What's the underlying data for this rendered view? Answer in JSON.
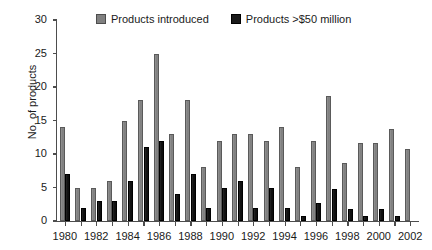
{
  "chart_data": {
    "type": "bar",
    "title": "",
    "xlabel": "",
    "ylabel": "No. of products",
    "ylim": [
      0,
      30
    ],
    "ytick_step": 5,
    "yticks": [
      0,
      5,
      10,
      15,
      20,
      25,
      30
    ],
    "grid": false,
    "legend_position": "top-center",
    "xtick_labels": [
      "1980",
      "1982",
      "1984",
      "1986",
      "1988",
      "1990",
      "1992",
      "1994",
      "1996",
      "1998",
      "2000",
      "2002"
    ],
    "categories": [
      "1980",
      "1981",
      "1982",
      "1983",
      "1984",
      "1985",
      "1986",
      "1987",
      "1988",
      "1989",
      "1990",
      "1991",
      "1992",
      "1993",
      "1994",
      "1995",
      "1996",
      "1997",
      "1998",
      "1999",
      "2000",
      "2001",
      "2002"
    ],
    "series": [
      {
        "name": "Products introduced",
        "color": "#808080",
        "values": [
          14,
          5,
          5,
          6,
          15,
          18,
          25,
          13,
          18,
          8,
          12,
          13,
          13,
          12,
          14,
          8,
          12,
          18.7,
          8.7,
          11.7,
          11.7,
          13.8,
          10.7
        ]
      },
      {
        "name": "Products >$50 million",
        "color": "#1a1a1a",
        "values": [
          7,
          2,
          3,
          3,
          6,
          11,
          12,
          4,
          7,
          2,
          5,
          6,
          2,
          5,
          2,
          0.8,
          2.7,
          4.8,
          1.8,
          0.8,
          1.8,
          0.8,
          0
        ]
      }
    ]
  },
  "legend": {
    "items": [
      {
        "label": "Products introduced",
        "swatch": "legend-swatch-gray"
      },
      {
        "label": "Products >$50 million",
        "swatch": "legend-swatch-black"
      }
    ]
  },
  "axes": {
    "y_title": "No. of products"
  }
}
